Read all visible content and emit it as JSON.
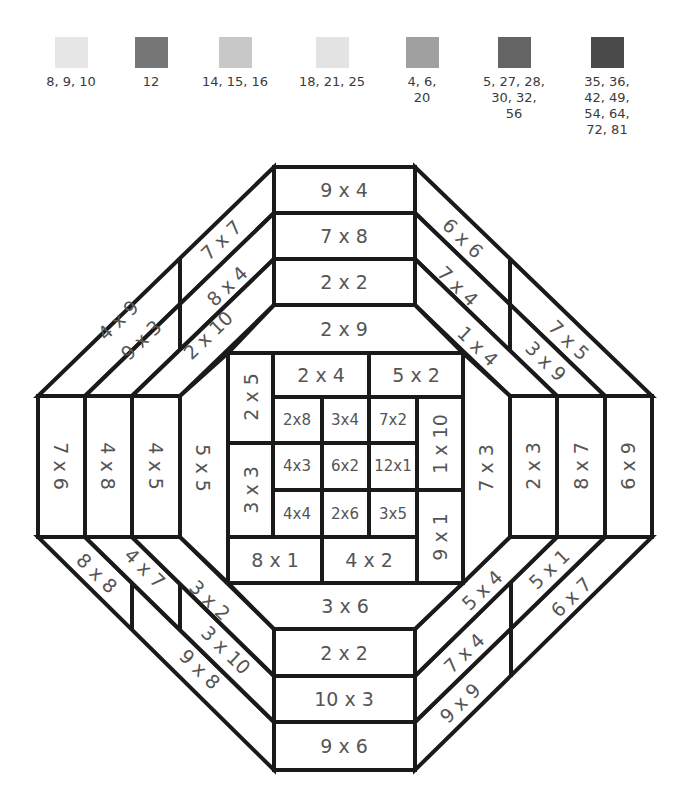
{
  "legend": [
    {
      "label": "8, 9, 10",
      "color": "#e6e6e6",
      "cx": 71
    },
    {
      "label": "12",
      "color": "#777777",
      "cx": 151
    },
    {
      "label": "14, 15, 16",
      "color": "#c8c8c8",
      "cx": 235
    },
    {
      "label": "18, 21, 25",
      "color": "#e3e3e3",
      "cx": 332
    },
    {
      "label": "4, 6,\n20",
      "color": "#a0a0a0",
      "cx": 422
    },
    {
      "label": "5, 27, 28,\n30, 32,\n56",
      "color": "#646464",
      "cx": 514
    },
    {
      "label": "35, 36,\n42, 49,\n54, 64,\n72, 81",
      "color": "#4a4a4a",
      "cx": 607
    }
  ],
  "puzzle": {
    "top_band": [
      "9 x 4",
      "7 x 8",
      "2 x 2"
    ],
    "top_inner": "2 x 9",
    "bottom_inner": "3 x 6",
    "bottom_band": [
      "2 x 2",
      "10 x 3",
      "9 x 6"
    ],
    "left_band": [
      "7 x 6",
      "4 x 8",
      "4 x 5"
    ],
    "left_inner": "5 x 5",
    "right_inner": "7 x 3",
    "right_band": [
      "2 x 3",
      "8 x 7",
      "6 x 9"
    ],
    "top_left_diag": {
      "outer": [
        "4 x 9",
        "7 x 7"
      ],
      "middle": [
        "9 x 3",
        "8 x 4"
      ],
      "inner": "2 x 10"
    },
    "top_right_diag": {
      "outer": [
        "6 x 6",
        "7 x 5"
      ],
      "middle": [
        "7 x 4",
        "3 x 9"
      ],
      "inner": "1 x 4"
    },
    "bottom_left_diag": {
      "outer": [
        "8 x 8",
        "9 x 8"
      ],
      "middle": [
        "4 x 7",
        "3 x 10"
      ],
      "inner": "3 x 2"
    },
    "bottom_right_diag": {
      "outer": [
        "5 x 1",
        "6 x 7"
      ],
      "middle": [
        "7 x 4",
        "9 x 9"
      ],
      "inner": "5 x 4"
    },
    "center": {
      "left_top": "2 x 5",
      "left_bottom": "3 x 3",
      "top_left": "2 x 4",
      "top_right": "5 x 2",
      "right_top": "1 x 10",
      "right_bottom": "9 x 1",
      "bottom_left": "8 x 1",
      "bottom_right": "4 x 2",
      "grid": [
        [
          "2x8",
          "3x4",
          "7x2"
        ],
        [
          "4x3",
          "6x2",
          "12x1"
        ],
        [
          "4x4",
          "2x6",
          "3x5"
        ]
      ]
    }
  }
}
